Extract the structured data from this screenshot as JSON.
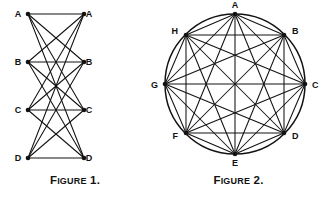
{
  "page": {
    "background_color": "#ffffff",
    "ink_color": "#121212",
    "width": 327,
    "height": 197
  },
  "figures": [
    {
      "id": "figure-1",
      "caption_lead": "F",
      "caption_rest": "IGURE",
      "caption_number": " 1.",
      "caption_full": "FIGURE 1.",
      "type": "bipartite-graph",
      "description": "Two vertical columns of four labelled points joined by straight segments",
      "layout": {
        "left_column_x": 28,
        "right_column_x": 84,
        "row_y": [
          14,
          62,
          110,
          158
        ]
      },
      "vertices": [
        {
          "label": "A",
          "side": "left",
          "x": 28,
          "y": 14,
          "label_x": 18,
          "label_y": 17
        },
        {
          "label": "A",
          "side": "right",
          "x": 84,
          "y": 14,
          "label_x": 89,
          "label_y": 17
        },
        {
          "label": "B",
          "side": "left",
          "x": 28,
          "y": 62,
          "label_x": 18,
          "label_y": 65
        },
        {
          "label": "B",
          "side": "right",
          "x": 84,
          "y": 62,
          "label_x": 89,
          "label_y": 65
        },
        {
          "label": "C",
          "side": "left",
          "x": 28,
          "y": 110,
          "label_x": 18,
          "label_y": 113
        },
        {
          "label": "C",
          "side": "right",
          "x": 84,
          "y": 110,
          "label_x": 89,
          "label_y": 113
        },
        {
          "label": "D",
          "side": "left",
          "x": 28,
          "y": 158,
          "label_x": 18,
          "label_y": 161
        },
        {
          "label": "D",
          "side": "right",
          "x": 84,
          "y": 158,
          "label_x": 89,
          "label_y": 161
        }
      ],
      "edges": [
        [
          0,
          1
        ],
        [
          0,
          3
        ],
        [
          0,
          5
        ],
        [
          0,
          7
        ],
        [
          2,
          1
        ],
        [
          2,
          3
        ],
        [
          2,
          5
        ],
        [
          2,
          7
        ],
        [
          4,
          1
        ],
        [
          4,
          3
        ],
        [
          4,
          5
        ],
        [
          4,
          7
        ],
        [
          6,
          1
        ],
        [
          6,
          3
        ],
        [
          6,
          5
        ],
        [
          6,
          7
        ]
      ]
    },
    {
      "id": "figure-2",
      "caption_lead": "F",
      "caption_rest": "IGURE",
      "caption_number": " 2.",
      "caption_full": "FIGURE 2.",
      "type": "complete-graph-on-circle",
      "description": "Eight labelled points equally spaced on a circle, every pair joined",
      "circle": {
        "cx": 85,
        "cy": 84,
        "r": 70
      },
      "vertices": [
        {
          "label": "A",
          "x": 85,
          "y": 14,
          "label_x": 85,
          "label_y": 8,
          "anchor": "middle"
        },
        {
          "label": "B",
          "x": 134,
          "y": 35,
          "label_x": 142,
          "label_y": 34,
          "anchor": "start"
        },
        {
          "label": "C",
          "x": 155,
          "y": 84,
          "label_x": 162,
          "label_y": 88,
          "anchor": "start"
        },
        {
          "label": "D",
          "x": 134,
          "y": 133,
          "label_x": 142,
          "label_y": 139,
          "anchor": "start"
        },
        {
          "label": "E",
          "x": 85,
          "y": 154,
          "label_x": 85,
          "label_y": 166,
          "anchor": "middle"
        },
        {
          "label": "F",
          "x": 36,
          "y": 133,
          "label_x": 28,
          "label_y": 139,
          "anchor": "end"
        },
        {
          "label": "G",
          "x": 15,
          "y": 84,
          "label_x": 8,
          "label_y": 88,
          "anchor": "end"
        },
        {
          "label": "H",
          "x": 36,
          "y": 35,
          "label_x": 28,
          "label_y": 34,
          "anchor": "end"
        }
      ],
      "edges": [
        [
          0,
          1
        ],
        [
          0,
          2
        ],
        [
          0,
          3
        ],
        [
          0,
          4
        ],
        [
          0,
          5
        ],
        [
          0,
          6
        ],
        [
          0,
          7
        ],
        [
          1,
          2
        ],
        [
          1,
          3
        ],
        [
          1,
          4
        ],
        [
          1,
          5
        ],
        [
          1,
          6
        ],
        [
          1,
          7
        ],
        [
          2,
          3
        ],
        [
          2,
          4
        ],
        [
          2,
          5
        ],
        [
          2,
          6
        ],
        [
          2,
          7
        ],
        [
          3,
          4
        ],
        [
          3,
          5
        ],
        [
          3,
          6
        ],
        [
          3,
          7
        ],
        [
          4,
          5
        ],
        [
          4,
          6
        ],
        [
          4,
          7
        ],
        [
          5,
          6
        ],
        [
          5,
          7
        ],
        [
          6,
          7
        ]
      ]
    }
  ]
}
